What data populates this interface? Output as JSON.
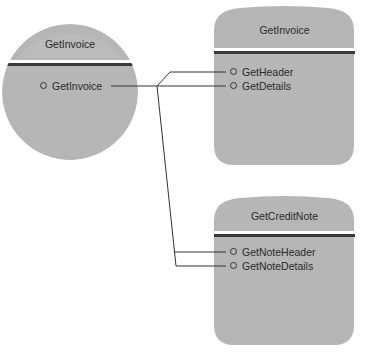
{
  "diagram": {
    "colors": {
      "shape_fill": "#b4b4b4",
      "shape_fill_light": "#bdbdbd",
      "divider": "#3a3a3a",
      "connector": "#333333",
      "text": "#2a2a2a",
      "background": "#ffffff"
    },
    "client": {
      "shape": "circle",
      "title": "GetInvoice",
      "items": [
        {
          "label": "GetInvoice"
        }
      ]
    },
    "components": [
      {
        "shape": "rounded-card",
        "title": "GetInvoice",
        "items": [
          {
            "label": "GetHeader"
          },
          {
            "label": "GetDetails"
          }
        ]
      },
      {
        "shape": "rounded-card",
        "title": "GetCreditNote",
        "items": [
          {
            "label": "GetNoteHeader"
          },
          {
            "label": "GetNoteDetails"
          }
        ]
      }
    ],
    "connections": [
      {
        "from": "client.GetInvoice",
        "to": "components.0.GetHeader"
      },
      {
        "from": "client.GetInvoice",
        "to": "components.0.GetDetails"
      },
      {
        "from": "client.GetInvoice",
        "to": "components.1.GetNoteHeader"
      },
      {
        "from": "client.GetInvoice",
        "to": "components.1.GetNoteDetails"
      }
    ]
  }
}
